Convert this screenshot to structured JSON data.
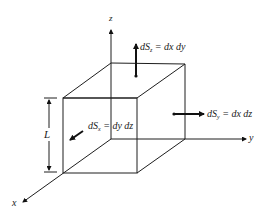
{
  "diagram": {
    "type": "cube-surface-elements",
    "axes": {
      "x": {
        "label": "x"
      },
      "y": {
        "label": "y"
      },
      "z": {
        "label": "z"
      }
    },
    "dimension": {
      "label": "L"
    },
    "surface_elements": [
      {
        "id": "dSz",
        "prefix": "dS",
        "subscript": "z",
        "equals": " = dx dy"
      },
      {
        "id": "dSy",
        "prefix": "dS",
        "subscript": "y",
        "equals": " = dx dz"
      },
      {
        "id": "dSx",
        "prefix": "dS",
        "subscript": "x",
        "equals": " = dy dz"
      }
    ],
    "colors": {
      "ink": "#1e1e1e",
      "background": "#ffffff"
    }
  }
}
